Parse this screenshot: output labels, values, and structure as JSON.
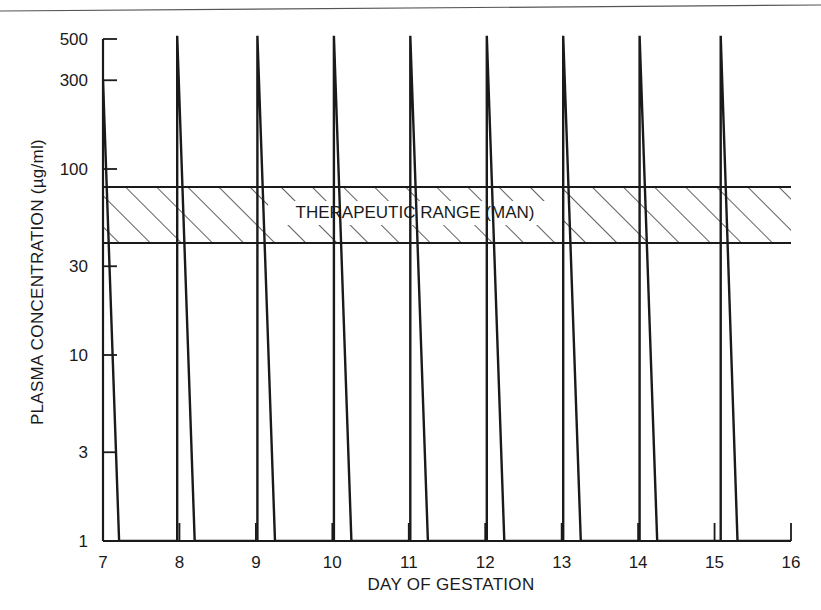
{
  "chart_data": {
    "type": "line",
    "title": "",
    "xlabel": "DAY OF GESTATION",
    "ylabel": "PLASMA CONCENTRATION (µg/ml)",
    "yscale": "log",
    "xlim": [
      7,
      16
    ],
    "ylim": [
      1,
      500
    ],
    "x_ticks": [
      7,
      8,
      9,
      10,
      11,
      12,
      13,
      14,
      15,
      16
    ],
    "x_tick_labels": [
      "7",
      "8",
      "9",
      "10",
      "11",
      "12",
      "13",
      "14",
      "15",
      "16"
    ],
    "y_ticks": [
      1,
      3,
      10,
      30,
      100,
      300,
      500
    ],
    "y_tick_labels": [
      "1",
      "3",
      "10",
      "30",
      "100",
      "300",
      "500"
    ],
    "grid": false,
    "legend": null,
    "annotations": [
      {
        "type": "hatched_band",
        "label": "THERAPEUTIC RANGE (MAN)",
        "y_low": 40,
        "y_high": 80,
        "x_start": 7,
        "x_end": 16
      }
    ],
    "series": [
      {
        "name": "Plasma concentration",
        "description": "Daily dose spikes: rapid rise to ~520 µg/ml then decay to ~1 µg/ml within ~0.23 day",
        "points": [
          {
            "x": 7.0,
            "y": 300
          },
          {
            "x": 7.21,
            "y": 1
          },
          {
            "x": 7.97,
            "y": 1
          },
          {
            "x": 7.97,
            "y": 520
          },
          {
            "x": 8.2,
            "y": 1
          },
          {
            "x": 9.02,
            "y": 1
          },
          {
            "x": 9.02,
            "y": 520
          },
          {
            "x": 9.25,
            "y": 1
          },
          {
            "x": 10.02,
            "y": 1
          },
          {
            "x": 10.02,
            "y": 520
          },
          {
            "x": 10.25,
            "y": 1
          },
          {
            "x": 11.02,
            "y": 1
          },
          {
            "x": 11.02,
            "y": 520
          },
          {
            "x": 11.25,
            "y": 1
          },
          {
            "x": 12.02,
            "y": 1
          },
          {
            "x": 12.02,
            "y": 520
          },
          {
            "x": 12.25,
            "y": 1
          },
          {
            "x": 13.02,
            "y": 1
          },
          {
            "x": 13.02,
            "y": 520
          },
          {
            "x": 13.25,
            "y": 1
          },
          {
            "x": 14.02,
            "y": 1
          },
          {
            "x": 14.02,
            "y": 520
          },
          {
            "x": 14.25,
            "y": 1
          },
          {
            "x": 15.08,
            "y": 1
          },
          {
            "x": 15.08,
            "y": 520
          },
          {
            "x": 15.3,
            "y": 1
          },
          {
            "x": 16.0,
            "y": 1
          }
        ]
      }
    ]
  },
  "labels": {
    "xlabel": "DAY OF GESTATION",
    "ylabel": "PLASMA CONCENTRATION (µg/ml)",
    "band_label": "THERAPEUTIC RANGE (MAN)"
  }
}
